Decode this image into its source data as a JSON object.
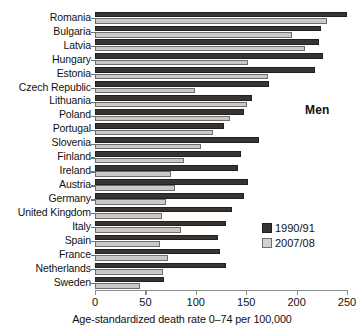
{
  "chart_data": {
    "type": "bar",
    "orientation": "horizontal",
    "title": "",
    "annotation": "Men",
    "xlabel": "Age-standardized death rate 0–74 per 100,000",
    "ylabel": "",
    "xlim": [
      0,
      250
    ],
    "xticks": [
      0,
      50,
      100,
      150,
      200,
      250
    ],
    "grid": false,
    "legend_position": "right",
    "categories": [
      "Romania",
      "Bulgaria",
      "Latvia",
      "Hungary",
      "Estonia",
      "Czech Republic",
      "Lithuania",
      "Poland",
      "Portugal",
      "Slovenia",
      "Finland",
      "Ireland",
      "Austria",
      "Germany",
      "United Kingdom",
      "Italy",
      "Spain",
      "France",
      "Netherlands",
      "Sweden"
    ],
    "series": [
      {
        "name": "1990/91",
        "color": "#3a3431",
        "values": [
          250,
          224,
          222,
          226,
          218,
          173,
          156,
          148,
          128,
          163,
          145,
          142,
          152,
          148,
          136,
          130,
          122,
          124,
          130,
          68
        ]
      },
      {
        "name": "2007/08",
        "color": "#c9c9c9",
        "values": [
          230,
          195,
          208,
          152,
          172,
          99,
          151,
          134,
          117,
          105,
          88,
          75,
          79,
          70,
          66,
          85,
          64,
          72,
          67,
          45
        ]
      }
    ]
  },
  "legend": {
    "items": [
      {
        "label": "1990/91",
        "swatch": "dark"
      },
      {
        "label": "2007/08",
        "swatch": "light"
      }
    ]
  }
}
